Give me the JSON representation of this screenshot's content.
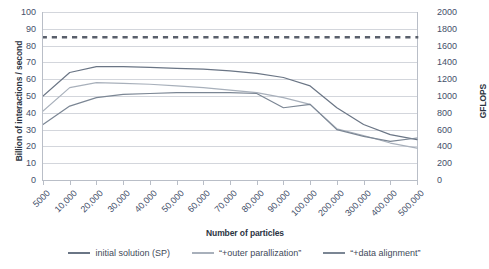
{
  "chart_data": {
    "type": "line",
    "title": "",
    "xlabel": "Number of particles",
    "ylabel": "Billion of interactions / second",
    "ylabel_secondary": "GFLOPS",
    "categories": [
      "5000",
      "10,000",
      "20,000",
      "30,000",
      "40,000",
      "50,000",
      "60,000",
      "70,000",
      "80,000",
      "90,000",
      "100,000",
      "200,000",
      "300,000",
      "400,000",
      "500,000"
    ],
    "ylim": [
      0,
      100
    ],
    "yticks": [
      0,
      10,
      20,
      30,
      40,
      50,
      60,
      70,
      80,
      90,
      100
    ],
    "ylim_secondary": [
      0,
      2000
    ],
    "yticks_secondary": [
      0,
      200,
      400,
      600,
      800,
      1000,
      1200,
      1400,
      1600,
      1800,
      2000
    ],
    "grid": true,
    "legend_position": "bottom",
    "series": [
      {
        "name": "initial solution (SP)",
        "style": "solid",
        "color": "#6a7585",
        "values": [
          50,
          64,
          67.5,
          67.5,
          67,
          66.5,
          66,
          65,
          63.5,
          61,
          56,
          43,
          33,
          27,
          24
        ]
      },
      {
        "name": "“+outer parallization”",
        "style": "solid",
        "color": "#a8b0bb",
        "values": [
          41,
          55,
          58,
          57.5,
          57,
          56,
          55,
          53.5,
          52,
          49,
          45,
          30.5,
          26.5,
          22,
          19
        ]
      },
      {
        "name": "“+data alignment”",
        "style": "solid",
        "color": "#7b8694",
        "values": [
          33,
          44,
          49,
          51,
          51.5,
          52,
          52,
          52,
          51.5,
          43,
          45,
          30,
          26,
          23,
          25
        ]
      },
      {
        "name": "peak reference",
        "style": "dotted",
        "color": "#595f6b",
        "values": [
          85,
          85,
          85,
          85,
          85,
          85,
          85,
          85,
          85,
          85,
          85,
          85,
          85,
          85,
          85
        ]
      }
    ]
  },
  "legend": {
    "items": [
      {
        "label": "initial solution (SP)",
        "color": "#6a7585"
      },
      {
        "label": "“+outer parallization”",
        "color": "#a8b0bb"
      },
      {
        "label": "“+data alignment”",
        "color": "#7b8694"
      }
    ]
  },
  "colors": {
    "grid": "#d3d6dc",
    "axis": "#b9bec7",
    "text": "#44506a",
    "title": "#2c3442"
  }
}
